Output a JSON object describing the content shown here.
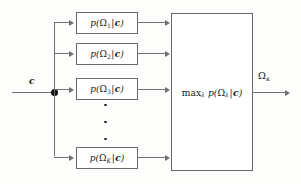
{
  "figure": {
    "background_color": "#fdfdfc",
    "line_color": "#6f6f6f"
  },
  "input": {
    "label": "c",
    "junction_name": "fan-out-node"
  },
  "branches": [
    {
      "id": "branch-1",
      "prefix": "p(",
      "symbol": "Ω",
      "subscript": "1",
      "bar": "|",
      "cond": "c",
      "suffix": ")",
      "label": "p(Ω₁|c)"
    },
    {
      "id": "branch-2",
      "prefix": "p(",
      "symbol": "Ω",
      "subscript": "2",
      "bar": "|",
      "cond": "c",
      "suffix": ")",
      "label": "p(Ω₂|c)"
    },
    {
      "id": "branch-3",
      "prefix": "p(",
      "symbol": "Ω",
      "subscript": "3",
      "bar": "|",
      "cond": "c",
      "suffix": ")",
      "label": "p(Ω₃|c)"
    },
    {
      "id": "branch-K",
      "prefix": "p(",
      "symbol": "Ω",
      "subscript": "K",
      "bar": "|",
      "cond": "c",
      "suffix": ")",
      "label": "p(Ω_K|c)"
    }
  ],
  "ellipsis": {
    "label": "vertical-ellipsis",
    "dots": 3
  },
  "max_block": {
    "op": "max",
    "op_subscript": "λ",
    "prefix": " p(",
    "symbol": "Ω",
    "subscript": "λ",
    "bar": "|",
    "cond": "c",
    "suffix": ")",
    "label": "maxλ p(Ωλ|c)"
  },
  "output": {
    "symbol": "Ω",
    "subscript": "κ",
    "label": "Ωκ"
  }
}
